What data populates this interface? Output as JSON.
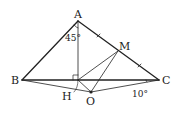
{
  "diagram": {
    "type": "geometry",
    "points": {
      "A": {
        "label": "A",
        "x": 78,
        "y": 21
      },
      "B": {
        "label": "B",
        "x": 22,
        "y": 80
      },
      "C": {
        "label": "C",
        "x": 159,
        "y": 80
      },
      "M": {
        "label": "M",
        "x": 118,
        "y": 51
      },
      "H": {
        "label": "H",
        "x": 78,
        "y": 80
      },
      "O": {
        "label": "O",
        "x": 91,
        "y": 92
      }
    },
    "angles": {
      "BAH": "45°",
      "OCB": "10°"
    },
    "segments": [
      "AB",
      "AC",
      "BC",
      "AH",
      "BO",
      "OC",
      "HM",
      "MO",
      "HO"
    ],
    "marks": {
      "right_angle_at": "H",
      "equal_ticks": [
        "AM",
        "MC"
      ]
    }
  }
}
